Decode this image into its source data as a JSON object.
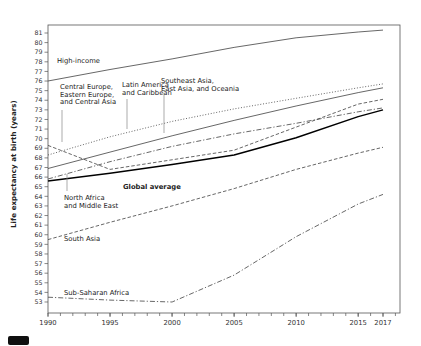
{
  "chart_data": {
    "type": "line",
    "title": "",
    "xlabel": "",
    "ylabel": "Life expectancy at birth (years)",
    "ylim": [
      53,
      81
    ],
    "xlim": [
      1990,
      2018
    ],
    "grid": false,
    "legend_position": "inline-labels",
    "x": [
      1990,
      1995,
      2000,
      2005,
      2010,
      2015,
      2017
    ],
    "series": [
      {
        "name": "High-income",
        "dash": "solid",
        "bold": false,
        "values": [
          76.0,
          77.2,
          78.3,
          79.5,
          80.5,
          81.1,
          81.3
        ]
      },
      {
        "name": "Central Europe, Eastern Europe, and Central Asia",
        "dash": "dashed",
        "bold": false,
        "values": [
          69.3,
          66.8,
          67.8,
          68.8,
          71.2,
          73.6,
          74.1
        ]
      },
      {
        "name": "Latin America and Caribbean",
        "dash": "dotted",
        "bold": false,
        "values": [
          68.3,
          70.2,
          71.8,
          73.1,
          74.2,
          75.3,
          75.7
        ]
      },
      {
        "name": "Southeast Asia, East Asia, and Oceania",
        "dash": "solid",
        "bold": false,
        "values": [
          66.9,
          68.6,
          70.3,
          71.9,
          73.4,
          74.8,
          75.3
        ]
      },
      {
        "name": "North Africa and Middle East",
        "dash": "dashdot",
        "bold": false,
        "values": [
          65.8,
          67.6,
          69.2,
          70.5,
          71.6,
          72.8,
          73.2
        ]
      },
      {
        "name": "Global average",
        "dash": "solid",
        "bold": true,
        "values": [
          65.6,
          66.4,
          67.3,
          68.3,
          70.1,
          72.3,
          73.0
        ]
      },
      {
        "name": "South Asia",
        "dash": "dashed",
        "bold": false,
        "values": [
          59.5,
          61.3,
          63.0,
          64.8,
          66.8,
          68.5,
          69.1
        ]
      },
      {
        "name": "Sub-Saharan Africa",
        "dash": "dashdot",
        "bold": false,
        "values": [
          53.5,
          53.2,
          53.0,
          55.8,
          59.8,
          63.2,
          64.2
        ]
      }
    ]
  },
  "annotations": [
    {
      "name": "high-income",
      "lines": [
        "High-income"
      ],
      "bold": false,
      "x": 57,
      "y": 63,
      "pointer": null
    },
    {
      "name": "central-europe",
      "lines": [
        "Central Europe,",
        "Eastern Europe,",
        "and Central Asia"
      ],
      "bold": false,
      "x": 60,
      "y": 89,
      "pointer": {
        "x": 62,
        "y1": 110,
        "y2": 142
      }
    },
    {
      "name": "latin-america",
      "lines": [
        "Latin America",
        "and Caribbean"
      ],
      "bold": false,
      "x": 122,
      "y": 87,
      "pointer": {
        "x": 127,
        "y1": 99,
        "y2": 129
      }
    },
    {
      "name": "southeast-asia",
      "lines": [
        "Southeast Asia,",
        "East Asia, and Oceania"
      ],
      "bold": false,
      "x": 161,
      "y": 83,
      "pointer": {
        "x": 164,
        "y1": 95,
        "y2": 133
      }
    },
    {
      "name": "global-average",
      "lines": [
        "Global average"
      ],
      "bold": true,
      "x": 123,
      "y": 189,
      "pointer": null
    },
    {
      "name": "north-africa",
      "lines": [
        "North Africa",
        "and Middle East"
      ],
      "bold": false,
      "x": 64,
      "y": 200,
      "pointer": {
        "x": 67,
        "y1": 174,
        "y2": 191
      }
    },
    {
      "name": "south-asia",
      "lines": [
        "South Asia"
      ],
      "bold": false,
      "x": 64,
      "y": 241,
      "pointer": null
    },
    {
      "name": "sub-saharan",
      "lines": [
        "Sub-Saharan Africa"
      ],
      "bold": false,
      "x": 64,
      "y": 295,
      "pointer": null
    }
  ],
  "axes": {
    "y_tick_min": 53,
    "y_tick_max": 81,
    "x_major_ticks": [
      "1990",
      "1995",
      "2000",
      "2005",
      "2010",
      "2015",
      "2017"
    ]
  }
}
